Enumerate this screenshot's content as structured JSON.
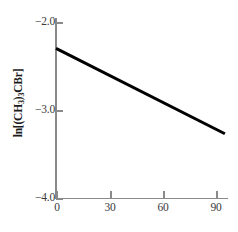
{
  "chart_data": {
    "type": "line",
    "title": "",
    "xlabel": "",
    "ylabel": "ln[(CH3)3CBr]",
    "ylabel_parts": {
      "pre": "ln[(CH",
      "sub1": "3",
      "mid": ")",
      "sub2": "3",
      "post": "CBr]"
    },
    "xlim": [
      0,
      95
    ],
    "ylim": [
      -4.0,
      -2.0
    ],
    "grid": false,
    "legend": "none",
    "x_ticks": [
      0,
      30,
      60,
      90
    ],
    "x_tick_labels": [
      "0",
      "30",
      "60",
      "90"
    ],
    "y_ticks": [
      -2.0,
      -3.0,
      -4.0
    ],
    "y_tick_labels": [
      "−2.0",
      "−3.0",
      "−4.0"
    ],
    "series": [
      {
        "name": "ln[(CH3)3CBr] vs time",
        "x": [
          0,
          95
        ],
        "values": [
          -2.3,
          -3.27
        ],
        "color": "#000000",
        "line_width": 3
      }
    ],
    "colors": {
      "axis": "#8a8a8a",
      "tick_label": "#3a3a3a",
      "axis_title": "#1a1a1a",
      "data_line": "#000000",
      "background": "#ffffff"
    }
  }
}
